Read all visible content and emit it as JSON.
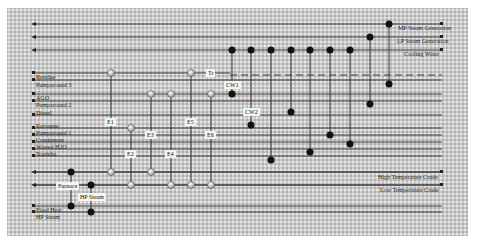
{
  "diagram": {
    "utility_lines_top": [
      {
        "label": "MP Steam Generation",
        "y": 24
      },
      {
        "label": "LP Steam Generation",
        "y": 37
      },
      {
        "label": "Cooling Water",
        "y": 50
      }
    ],
    "hot_streams": [
      {
        "label": "Residue",
        "y": 73
      },
      {
        "label": "Pumparound 3",
        "y": 80
      },
      {
        "label": "AGO",
        "y": 94
      },
      {
        "label": "Pumparound 2",
        "y": 101
      },
      {
        "label": "Diesel",
        "y": 115
      },
      {
        "label": "Kerosene",
        "y": 128
      },
      {
        "label": "Pumparound 1",
        "y": 135
      },
      {
        "label": "Condensate",
        "y": 142
      },
      {
        "label": "Wasted H2O",
        "y": 149
      },
      {
        "label": "Naphtha",
        "y": 156
      }
    ],
    "cold_streams": [
      {
        "label": "High Temperature Crude",
        "y": 172
      },
      {
        "label": "Low Temperature Crude",
        "y": 185
      }
    ],
    "utility_lines_bottom": [
      {
        "label": "Fired Heat",
        "y": 206
      },
      {
        "label": "HP Steam",
        "y": 212
      }
    ],
    "exchanger_labels": {
      "e1": "E1",
      "e2": "E2",
      "e3": "E3",
      "e4": "E4",
      "e5": "E5",
      "e6": "E6",
      "tr": "Tr",
      "cw1": "CW1",
      "cw2": "CW2",
      "furnace": "Furnace",
      "hp_steam": "HP Steam"
    },
    "colors": {
      "line": "#3a3a3a",
      "dark_node": "#111111",
      "light_node": "#e8e8e8",
      "background": "#c8c8c8"
    }
  }
}
